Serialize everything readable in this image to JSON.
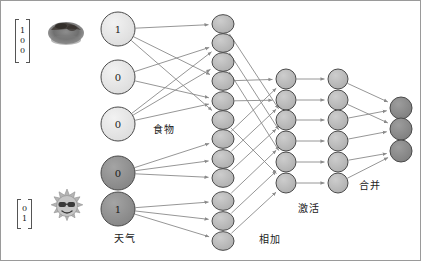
{
  "diagram": {
    "canvas": {
      "width": 421,
      "height": 261,
      "background": "#ffffff",
      "border_color": "#9a9a9a"
    }
  },
  "inputs": [
    {
      "name": "food-input",
      "vector": [
        "1",
        "0",
        "0"
      ],
      "thumbnail": "food-photo-icon",
      "thumbnail_alt": "dark round food item photo"
    },
    {
      "name": "weather-input",
      "vector": [
        "0",
        "1"
      ],
      "thumbnail": "sun-sunglasses-icon",
      "thumbnail_alt": "smiling sun wearing sunglasses"
    }
  ],
  "labels": {
    "food": "食物",
    "weather": "天气",
    "add": "相加",
    "activate": "激活",
    "merge": "合并"
  },
  "colors": {
    "node_light": "#e6e6e6",
    "node_mid": "#b9b9b9",
    "node_dark": "#8f8f8f",
    "node_output": "#8a8a8a",
    "node_stroke": "#4a4a4a",
    "edge": "#8a8a8a",
    "text": "#1a1a1a"
  },
  "layers": [
    {
      "name": "input-food",
      "label_key": "food",
      "shade": "node_light",
      "nodes": [
        {
          "value": "1",
          "cx": 117,
          "cy": 28,
          "r": 17
        },
        {
          "value": "0",
          "cx": 117,
          "cy": 76,
          "r": 17
        },
        {
          "value": "0",
          "cx": 117,
          "cy": 123,
          "r": 17
        }
      ],
      "label_pos": {
        "x": 152,
        "y": 120
      }
    },
    {
      "name": "input-weather",
      "label_key": "weather",
      "shade": "node_dark",
      "nodes": [
        {
          "value": "0",
          "cx": 117,
          "cy": 172,
          "r": 17
        },
        {
          "value": "1",
          "cx": 117,
          "cy": 208,
          "r": 17
        }
      ],
      "label_pos": {
        "x": 113,
        "y": 229
      }
    },
    {
      "name": "add-layer",
      "label_key": "add",
      "shade": "node_mid",
      "nodes": [
        {
          "value": "",
          "cx": 222,
          "cy": 23,
          "r": 11
        },
        {
          "value": "",
          "cx": 222,
          "cy": 42,
          "r": 11
        },
        {
          "value": "",
          "cx": 222,
          "cy": 61,
          "r": 11
        },
        {
          "value": "",
          "cx": 222,
          "cy": 80,
          "r": 11
        },
        {
          "value": "",
          "cx": 222,
          "cy": 100,
          "r": 11
        },
        {
          "value": "",
          "cx": 222,
          "cy": 119,
          "r": 11
        },
        {
          "value": "",
          "cx": 222,
          "cy": 138,
          "r": 11
        },
        {
          "value": "",
          "cx": 222,
          "cy": 158,
          "r": 11
        },
        {
          "value": "",
          "cx": 222,
          "cy": 177,
          "r": 11
        },
        {
          "value": "",
          "cx": 222,
          "cy": 200,
          "r": 11
        },
        {
          "value": "",
          "cx": 222,
          "cy": 220,
          "r": 11
        },
        {
          "value": "",
          "cx": 222,
          "cy": 240,
          "r": 11
        }
      ],
      "label_pos": {
        "x": 258,
        "y": 238
      }
    },
    {
      "name": "activate-layer",
      "label_key": "activate",
      "shade": "node_mid",
      "nodes": [
        {
          "value": "",
          "cx": 285,
          "cy": 78,
          "r": 10
        },
        {
          "value": "",
          "cx": 285,
          "cy": 99,
          "r": 10
        },
        {
          "value": "",
          "cx": 285,
          "cy": 119,
          "r": 10
        },
        {
          "value": "",
          "cx": 285,
          "cy": 140,
          "r": 10
        },
        {
          "value": "",
          "cx": 285,
          "cy": 161,
          "r": 10
        },
        {
          "value": "",
          "cx": 285,
          "cy": 182,
          "r": 10
        }
      ],
      "label_pos": {
        "x": 297,
        "y": 209
      }
    },
    {
      "name": "merge-layer",
      "label_key": "merge",
      "shade": "node_mid",
      "nodes": [
        {
          "value": "",
          "cx": 337,
          "cy": 78,
          "r": 10
        },
        {
          "value": "",
          "cx": 337,
          "cy": 99,
          "r": 10
        },
        {
          "value": "",
          "cx": 337,
          "cy": 119,
          "r": 10
        },
        {
          "value": "",
          "cx": 337,
          "cy": 140,
          "r": 10
        },
        {
          "value": "",
          "cx": 337,
          "cy": 161,
          "r": 10
        },
        {
          "value": "",
          "cx": 337,
          "cy": 182,
          "r": 10
        }
      ],
      "label_pos": {
        "x": 358,
        "y": 183
      }
    },
    {
      "name": "output-layer",
      "label_key": null,
      "shade": "node_output",
      "nodes": [
        {
          "value": "",
          "cx": 400,
          "cy": 107,
          "r": 11
        },
        {
          "value": "",
          "cx": 400,
          "cy": 128,
          "r": 11
        },
        {
          "value": "",
          "cx": 400,
          "cy": 150,
          "r": 11
        }
      ],
      "label_pos": null
    }
  ],
  "edges": [
    {
      "from": [
        0,
        0
      ],
      "to": [
        2,
        0
      ]
    },
    {
      "from": [
        0,
        0
      ],
      "to": [
        2,
        3
      ]
    },
    {
      "from": [
        0,
        0
      ],
      "to": [
        2,
        5
      ]
    },
    {
      "from": [
        0,
        1
      ],
      "to": [
        2,
        1
      ]
    },
    {
      "from": [
        0,
        1
      ],
      "to": [
        2,
        4
      ]
    },
    {
      "from": [
        0,
        2
      ],
      "to": [
        2,
        1
      ]
    },
    {
      "from": [
        0,
        2
      ],
      "to": [
        2,
        2
      ]
    },
    {
      "from": [
        0,
        2
      ],
      "to": [
        2,
        4
      ]
    },
    {
      "from": [
        1,
        0
      ],
      "to": [
        2,
        6
      ]
    },
    {
      "from": [
        1,
        0
      ],
      "to": [
        2,
        7
      ]
    },
    {
      "from": [
        1,
        0
      ],
      "to": [
        2,
        8
      ]
    },
    {
      "from": [
        1,
        1
      ],
      "to": [
        2,
        9
      ]
    },
    {
      "from": [
        1,
        1
      ],
      "to": [
        2,
        10
      ]
    },
    {
      "from": [
        1,
        1
      ],
      "to": [
        2,
        11
      ]
    },
    {
      "from": [
        2,
        0
      ],
      "to": [
        3,
        2
      ]
    },
    {
      "from": [
        2,
        1
      ],
      "to": [
        3,
        3
      ]
    },
    {
      "from": [
        2,
        2
      ],
      "to": [
        3,
        4
      ]
    },
    {
      "from": [
        2,
        3
      ],
      "to": [
        3,
        0
      ]
    },
    {
      "from": [
        2,
        4
      ],
      "to": [
        3,
        1
      ]
    },
    {
      "from": [
        2,
        5
      ],
      "to": [
        3,
        5
      ]
    },
    {
      "from": [
        2,
        6
      ],
      "to": [
        3,
        0
      ]
    },
    {
      "from": [
        2,
        7
      ],
      "to": [
        3,
        1
      ]
    },
    {
      "from": [
        2,
        8
      ],
      "to": [
        3,
        2
      ]
    },
    {
      "from": [
        2,
        9
      ],
      "to": [
        3,
        3
      ]
    },
    {
      "from": [
        2,
        10
      ],
      "to": [
        3,
        4
      ]
    },
    {
      "from": [
        2,
        11
      ],
      "to": [
        3,
        5
      ]
    },
    {
      "from": [
        3,
        0
      ],
      "to": [
        4,
        0
      ]
    },
    {
      "from": [
        3,
        1
      ],
      "to": [
        4,
        1
      ]
    },
    {
      "from": [
        3,
        2
      ],
      "to": [
        4,
        2
      ]
    },
    {
      "from": [
        3,
        3
      ],
      "to": [
        4,
        3
      ]
    },
    {
      "from": [
        3,
        4
      ],
      "to": [
        4,
        4
      ]
    },
    {
      "from": [
        3,
        5
      ],
      "to": [
        4,
        5
      ]
    },
    {
      "from": [
        4,
        0
      ],
      "to": [
        5,
        0
      ]
    },
    {
      "from": [
        4,
        1
      ],
      "to": [
        5,
        1
      ]
    },
    {
      "from": [
        4,
        2
      ],
      "to": [
        5,
        0
      ]
    },
    {
      "from": [
        4,
        3
      ],
      "to": [
        5,
        1
      ]
    },
    {
      "from": [
        4,
        4
      ],
      "to": [
        5,
        2
      ]
    },
    {
      "from": [
        4,
        5
      ],
      "to": [
        5,
        2
      ]
    }
  ]
}
